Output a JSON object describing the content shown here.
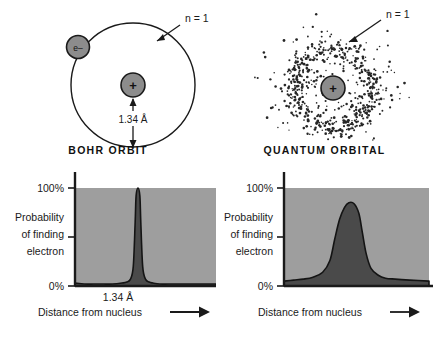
{
  "colors": {
    "ink": "#1a1a1a",
    "plot_background": "#9e9e9e",
    "curve_fill": "#4a4a4a",
    "sphere_fill": "#8c8c8c",
    "dot": "#262626",
    "page_background": "#ffffff"
  },
  "bohr_diagram": {
    "caption": "BOHR ORBIT",
    "shell_label": "n = 1",
    "electron_label": "e–",
    "nucleus_label": "+",
    "radius_label": "1.34 Å"
  },
  "quantum_diagram": {
    "caption": "QUANTUM ORBITAL",
    "shell_label": "n = 1",
    "nucleus_label": "+"
  },
  "bohr_chart": {
    "y_label_lines": [
      "Probability",
      "of finding",
      "electron"
    ],
    "y_ticks": [
      "100%",
      "0%"
    ],
    "x_label": "Distance from nucleus",
    "x_tick": "1.34 Å"
  },
  "quantum_chart": {
    "y_label_lines": [
      "Probability",
      "of finding",
      "electron"
    ],
    "y_ticks": [
      "100%",
      "0%"
    ],
    "x_label": "Distance from nucleus"
  },
  "chart_data": [
    {
      "type": "line",
      "id": "bohr-probability-distribution",
      "title": "BOHR ORBIT",
      "xlabel": "Distance from nucleus",
      "ylabel": "Probability of finding electron",
      "ylim": [
        0,
        100
      ],
      "ytick_labels": [
        "100%",
        "0%"
      ],
      "ytick_values": [
        100,
        0
      ],
      "xtick_labels": [
        "1.34 Å"
      ],
      "xtick_values": [
        1.34
      ],
      "grid": false,
      "legend": "none",
      "fill": true,
      "annotation": "Sharp spike: the electron is found only at exactly 1.34 Å",
      "x": [
        0.0,
        0.2,
        0.4,
        0.6,
        0.8,
        1.0,
        1.1,
        1.18,
        1.24,
        1.28,
        1.3,
        1.34,
        1.38,
        1.4,
        1.44,
        1.5,
        1.58,
        1.66,
        1.8,
        2.0,
        2.3,
        2.6,
        3.0
      ],
      "values": [
        3,
        2,
        2,
        2,
        2,
        3,
        4,
        7,
        20,
        65,
        92,
        100,
        92,
        65,
        20,
        7,
        4,
        3,
        2,
        2,
        2,
        2,
        2
      ]
    },
    {
      "type": "line",
      "id": "quantum-probability-distribution",
      "title": "QUANTUM ORBITAL",
      "xlabel": "Distance from nucleus",
      "ylabel": "Probability of finding electron",
      "ylim": [
        0,
        100
      ],
      "ytick_labels": [
        "100%",
        "0%"
      ],
      "ytick_values": [
        100,
        0
      ],
      "xtick_labels": [],
      "xtick_values": [],
      "grid": false,
      "legend": "none",
      "fill": true,
      "annotation": "Broad bell: the electron may be found over a range of distances, most likely near 1.34 Å",
      "x": [
        0.0,
        0.2,
        0.4,
        0.6,
        0.8,
        0.95,
        1.05,
        1.15,
        1.25,
        1.34,
        1.45,
        1.55,
        1.62,
        1.7,
        1.8,
        1.95,
        2.1,
        2.3,
        2.6,
        3.0
      ],
      "values": [
        5,
        6,
        7,
        9,
        14,
        26,
        48,
        68,
        80,
        85,
        84,
        74,
        55,
        33,
        18,
        11,
        8,
        7,
        6,
        5
      ]
    }
  ]
}
